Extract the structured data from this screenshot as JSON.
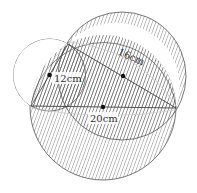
{
  "diagram": {
    "labels": {
      "side_ab": "12cm",
      "side_ac": "16cm",
      "side_bc": "20cm"
    },
    "colors": {
      "stroke": "#555555",
      "hatch": "#666666",
      "background": "#ffffff"
    }
  }
}
